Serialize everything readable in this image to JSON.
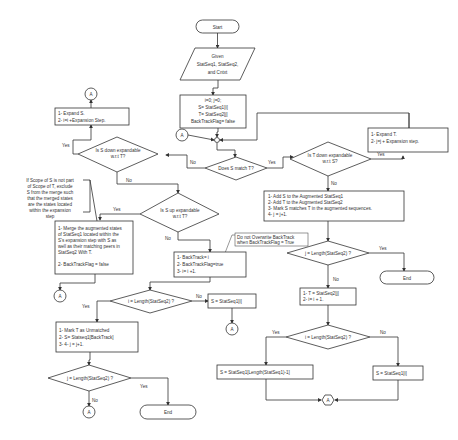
{
  "diagram": {
    "start": "Start",
    "given": [
      "Given",
      "StatSeq1, StatSeq2,",
      "and Cntxt"
    ],
    "init": [
      "i=0; j=0;",
      "S= StatSeq1[i]",
      "T= StatSeq2[j]",
      "BackTrackFlag= false"
    ],
    "connector_label": "A",
    "does_s_match": "Does S match T?",
    "is_t_down": [
      "Is T down expandable",
      "w.r.t S?"
    ],
    "expand_t": [
      "1- Expand T.",
      "2- j=j + Expansion step."
    ],
    "is_s_down": [
      "Is S down expandable",
      "w.r.t T?"
    ],
    "expand_s": [
      "1- Expand S.",
      "2- i=i +Expansion Step."
    ],
    "is_s_up": [
      "Is S up expandable",
      "w.r.t T?"
    ],
    "note_scope": [
      "If Scope of S is not part",
      "of Scope of T, exclude",
      "S from the merge such",
      "that the merged states",
      "are the states located",
      "within the expansion",
      "step"
    ],
    "merge": [
      "1-   Merge the augmented states",
      "of StatSeq1 located within the",
      "S's expansion step with S as",
      "well as their matching peers in",
      "StatSeq2 With T.",
      "",
      "2- BackTrackFlag = false"
    ],
    "add_s_t": [
      "1-   Add S to the Augmented StatSeq1",
      "2-   Add T to the Augmented StatSeq2",
      "3-   Mark S matches T in the augmented sequences.",
      "4-   j = j+1."
    ],
    "backtrack": [
      "1- BackTrack= i",
      "2- BackTrackFlag=true",
      "3- i= i +1."
    ],
    "note_overwrite": [
      "Do not Overwrite BackTrack",
      "when BackTrackFlag = True"
    ],
    "j_len_right": "j = Length(StatSeq2) ?",
    "t_next": [
      "1- T = StatSeq2[j]",
      "2- i= i + 1."
    ],
    "i_len_right": "i = Length(StatSeq2) ?",
    "s_last": "S = StatSeq1[Length(StatSeq1)-1]",
    "s_i_right": "S = StatSeq1[i]",
    "i_len_left": "i = Length(StatSeq2) ?",
    "s_i_mid": "S = StatSeq1[i]",
    "unmatched": [
      "1-   Mark T as Unmatched",
      "2-   S= Statseq1[BackTrack]",
      "3-   4-   j = j+1."
    ],
    "j_len_left": "j = Length(StatSeq2) ?",
    "end": "End",
    "labels": {
      "yes": "Yes",
      "no": "No"
    }
  }
}
